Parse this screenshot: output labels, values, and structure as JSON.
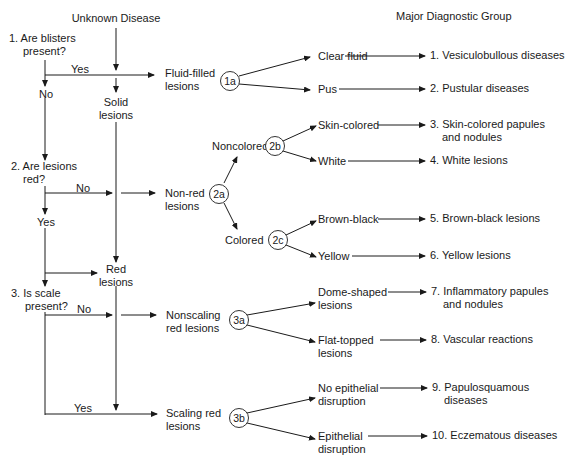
{
  "headers": {
    "start": "Unknown Disease",
    "right": "Major Diagnostic Group"
  },
  "questions": {
    "q1": {
      "line1": "1. Are blisters",
      "line2": "present?",
      "yes": "Yes",
      "no": "No"
    },
    "q2": {
      "line1": "2. Are lesions",
      "line2": "red?",
      "yes": "Yes",
      "no": "No"
    },
    "q3": {
      "line1": "3. Is scale",
      "line2": "present?",
      "yes": "Yes",
      "no": "No"
    }
  },
  "nodes": {
    "fluid_filled": {
      "line1": "Fluid-filled",
      "line2": "lesions"
    },
    "solid": {
      "line1": "Solid",
      "line2": "lesions"
    },
    "non_red": {
      "line1": "Non-red",
      "line2": "lesions"
    },
    "red": {
      "line1": "Red",
      "line2": "lesions"
    },
    "nonscaling": {
      "line1": "Nonscaling",
      "line2": "red lesions"
    },
    "scaling": {
      "line1": "Scaling red",
      "line2": "lesions"
    },
    "noncolored": "Noncolored",
    "colored": "Colored"
  },
  "branch_points": [
    "1a",
    "2a",
    "2b",
    "2c",
    "3a",
    "3b"
  ],
  "criteria": {
    "clear_fluid": {
      "line1": "Clear fluid",
      "line2": ""
    },
    "pus": {
      "line1": "Pus",
      "line2": ""
    },
    "skin_colored": {
      "line1": "Skin-colored",
      "line2": ""
    },
    "white": {
      "line1": "White",
      "line2": ""
    },
    "brown_black": {
      "line1": "Brown-black",
      "line2": ""
    },
    "yellow": {
      "line1": "Yellow",
      "line2": ""
    },
    "dome_shaped": {
      "line1": "Dome-shaped",
      "line2": "lesions"
    },
    "flat_topped": {
      "line1": "Flat-topped",
      "line2": "lesions"
    },
    "no_epithelial": {
      "line1": "No epithelial",
      "line2": "disruption"
    },
    "epithelial": {
      "line1": "Epithelial",
      "line2": "disruption"
    }
  },
  "groups": [
    {
      "line1": "1. Vesiculobullous diseases",
      "line2": ""
    },
    {
      "line1": "2. Pustular diseases",
      "line2": ""
    },
    {
      "line1": "3. Skin-colored papules",
      "line2": "and nodules"
    },
    {
      "line1": "4. White lesions",
      "line2": ""
    },
    {
      "line1": "5. Brown-black lesions",
      "line2": ""
    },
    {
      "line1": "6. Yellow lesions",
      "line2": ""
    },
    {
      "line1": "7. Inflammatory papules",
      "line2": "and nodules"
    },
    {
      "line1": "8. Vascular reactions",
      "line2": ""
    },
    {
      "line1": "9. Papulosquamous",
      "line2": "diseases"
    },
    {
      "line1": "10. Eczematous diseases",
      "line2": ""
    }
  ],
  "colors": {
    "ink": "#1a1a1a",
    "background": "#ffffff"
  }
}
